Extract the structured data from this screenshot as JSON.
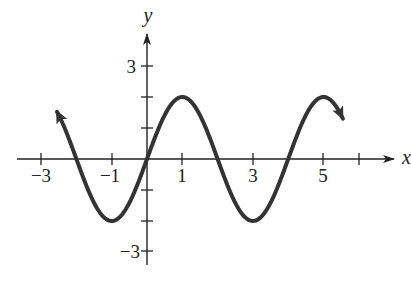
{
  "chart_data": {
    "type": "line",
    "title": "",
    "xlabel": "x",
    "ylabel": "y",
    "xlim": [
      -3.3,
      6.8
    ],
    "ylim": [
      -3.6,
      3.9
    ],
    "x_ticks": [
      -3,
      -2,
      -1,
      0,
      1,
      2,
      3,
      4,
      5,
      6
    ],
    "x_tick_labels": [
      "-3",
      "-1",
      "1",
      "3",
      "5"
    ],
    "x_labeled_ticks": [
      -3,
      -1,
      1,
      3,
      5
    ],
    "y_ticks": [
      -3,
      -2,
      -1,
      1,
      2,
      3
    ],
    "y_tick_labels": [
      "3",
      "-3"
    ],
    "y_labeled_ticks": [
      3,
      -3
    ],
    "grid": false,
    "legend": null,
    "series": [
      {
        "name": "y = 2 sin(πx/2)",
        "function": "2*sin(pi*x/2)",
        "amplitude": 2,
        "period": 4,
        "x_start": -2.55,
        "x_end": 5.55,
        "arrows": "both ends",
        "key_points": [
          {
            "x": -2,
            "y": 0
          },
          {
            "x": -1,
            "y": -2
          },
          {
            "x": 0,
            "y": 0
          },
          {
            "x": 1,
            "y": 2
          },
          {
            "x": 2,
            "y": 0
          },
          {
            "x": 3,
            "y": -2
          },
          {
            "x": 4,
            "y": 0
          },
          {
            "x": 5,
            "y": 2
          }
        ]
      }
    ]
  },
  "labels": {
    "x_axis": "x",
    "y_axis": "y",
    "x_ticks": {
      "m3": "−3",
      "m1": "−1",
      "p1": "1",
      "p3": "3",
      "p5": "5"
    },
    "y_ticks": {
      "p3": "3",
      "m3": "−3"
    }
  },
  "colors": {
    "curve": "#333333",
    "axis": "#222222",
    "background": "#ffffff"
  }
}
